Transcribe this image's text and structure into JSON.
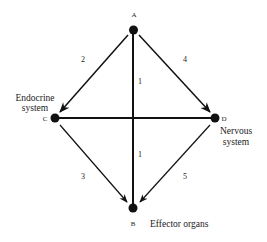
{
  "diagram": {
    "nodes": [
      {
        "id": "A",
        "label": "A",
        "description": ""
      },
      {
        "id": "C",
        "label": "C",
        "description_lines": [
          "Endocrine",
          "system"
        ]
      },
      {
        "id": "D",
        "label": "D",
        "description_lines": [
          "Nervous",
          "system"
        ]
      },
      {
        "id": "B",
        "label": "B",
        "description_lines": [
          "Effector organs"
        ]
      }
    ],
    "edges": [
      {
        "from": "A",
        "to": "B",
        "label": "1",
        "directed": false,
        "label_repeat": 2
      },
      {
        "from": "A",
        "to": "C",
        "label": "2",
        "directed": true
      },
      {
        "from": "C",
        "to": "B",
        "label": "3",
        "directed": true
      },
      {
        "from": "A",
        "to": "D",
        "label": "4",
        "directed": true
      },
      {
        "from": "D",
        "to": "B",
        "label": "5",
        "directed": true
      },
      {
        "from": "C",
        "to": "D",
        "label": "",
        "directed": false
      }
    ],
    "colors": {
      "ink": "#111111",
      "text": "#222222",
      "background": "#ffffff"
    }
  }
}
